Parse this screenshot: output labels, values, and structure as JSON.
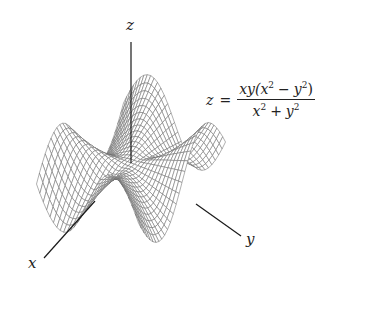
{
  "figure": {
    "type": "3d-surface-wireframe",
    "formula": {
      "lhs": "z",
      "eq": "=",
      "numerator": {
        "a": "xy(x",
        "a_sup": "2",
        "op": "−",
        "b": "y",
        "b_sup": "2",
        "close": ")"
      },
      "denominator": {
        "a": "x",
        "a_sup": "2",
        "op": "+",
        "b": "y",
        "b_sup": "2"
      },
      "text": "z = xy(x^2 - y^2)/(x^2 + y^2)"
    },
    "axes": {
      "x_label": "x",
      "y_label": "y",
      "z_label": "z"
    },
    "colors": {
      "mesh": "#6e6e6e",
      "axis": "#1a1a1a",
      "background": "#ffffff"
    }
  },
  "chart_data": {
    "type": "surface",
    "title": "",
    "function": "z = xy(x^2 - y^2)/(x^2 + y^2)",
    "xlabel": "x",
    "ylabel": "y",
    "zlabel": "z",
    "xlim": [
      -3,
      3
    ],
    "ylim": [
      -3,
      3
    ],
    "grid_n": 30,
    "grid": false,
    "legend": "none"
  }
}
